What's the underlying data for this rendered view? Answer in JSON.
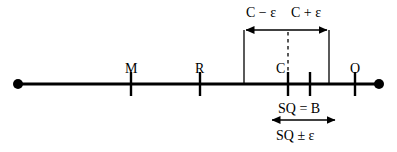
{
  "figure": {
    "background_color": "#ffffff",
    "stroke_color": "#000000",
    "width": 397,
    "height": 152
  },
  "number_line": {
    "name": "horizontal-number-line",
    "y": 84,
    "x_start": 17,
    "x_end": 380,
    "endpoint_left_label": "",
    "endpoint_right_label": "",
    "ticks": [
      {
        "id": "tick-M",
        "label": "M",
        "x": 131,
        "label_y": 62,
        "has_label": true
      },
      {
        "id": "tick-R",
        "label": "R",
        "x": 200,
        "label_y": 62,
        "has_label": true
      },
      {
        "id": "tick-C",
        "label": "C",
        "x": 288,
        "label_y": 62,
        "has_label": true
      },
      {
        "id": "tick-unlabeled",
        "label": "",
        "x": 310,
        "label_y": 62,
        "has_label": false
      },
      {
        "id": "tick-O",
        "label": "O",
        "x": 355,
        "label_y": 62,
        "has_label": true
      }
    ]
  },
  "tolerance_band": {
    "name": "tolerance-band",
    "left_bound_x": 244,
    "right_bound_x": 329,
    "center_dashed_x": 288,
    "vertical_top_y": 30,
    "vertical_bottom_y": 84,
    "arrow_y": 30,
    "label_left": "C − ε",
    "label_right": "C + ε",
    "label_left_x": 246,
    "label_right_x": 291,
    "label_y": 6
  },
  "measurement": {
    "name": "measurement-span",
    "arrow_left_x": 270,
    "arrow_right_x": 337,
    "arrow_y": 120,
    "label_top": "SQ = B",
    "label_bottom": "SQ ± ε",
    "label_top_x": 278,
    "label_top_y": 102,
    "label_bottom_x": 276,
    "label_bottom_y": 129
  },
  "colors": {
    "line": "#000000",
    "text": "#000000",
    "background": "#ffffff"
  }
}
